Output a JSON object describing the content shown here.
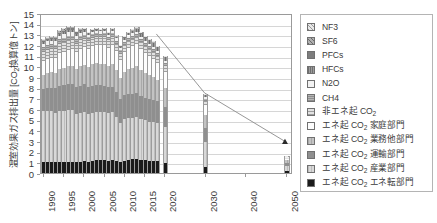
{
  "chart_data": {
    "type": "bar",
    "title": "",
    "ylabel": "温室効果ガス排出量 [CO2換算億トン]",
    "ylabel_main": "温室効果ガス排出量 [CO",
    "ylabel_sub": "2",
    "ylabel_tail": "換算億トン]",
    "xlabel": "",
    "ylim": [
      0,
      15
    ],
    "yticks": [
      0,
      1,
      2,
      3,
      4,
      5,
      6,
      7,
      8,
      9,
      10,
      11,
      12,
      13,
      14,
      15
    ],
    "grid": true,
    "legend_position": "right",
    "xlim": [
      1989.3,
      2051.5
    ],
    "xticks": [
      1990,
      1995,
      2000,
      2005,
      2010,
      2015,
      2020,
      2030,
      2040,
      2050
    ],
    "xtick_labels": [
      "1990",
      "1995",
      "2000",
      "2005",
      "2010",
      "2015",
      "2020",
      "2030",
      "2040",
      "2050"
    ],
    "series": [
      {
        "name": "エネ起 CO2 エネ転部門",
        "key": "enetenkan",
        "swatch": "s-enetenkan",
        "values": [
          1.02,
          1.03,
          1.03,
          1.02,
          1.07,
          1.06,
          1.07,
          1.06,
          1.03,
          1.07,
          1.09,
          1.07,
          1.14,
          1.2,
          1.18,
          1.18,
          1.15,
          1.2,
          1.13,
          1.06,
          1.1,
          1.21,
          1.27,
          1.29,
          1.26,
          1.21,
          1.17,
          1.14,
          1.1,
          0.96,
          0.55,
          0.22
        ]
      },
      {
        "name": "エネ起 CO2 産業部門",
        "key": "sangyo",
        "swatch": "s-sangyo",
        "values": [
          4.8,
          4.82,
          4.74,
          4.63,
          4.73,
          4.78,
          4.82,
          4.8,
          4.54,
          4.58,
          4.66,
          4.47,
          4.53,
          4.55,
          4.56,
          4.51,
          4.47,
          4.49,
          4.15,
          3.62,
          3.99,
          3.95,
          3.88,
          3.94,
          3.83,
          3.73,
          3.65,
          3.64,
          3.57,
          3.34,
          2.32,
          0.46
        ]
      },
      {
        "name": "エネ起 CO2 運輸部門",
        "key": "unyu",
        "swatch": "s-unyu",
        "values": [
          2.08,
          2.15,
          2.24,
          2.28,
          2.37,
          2.43,
          2.48,
          2.5,
          2.5,
          2.55,
          2.55,
          2.53,
          2.53,
          2.49,
          2.49,
          2.47,
          2.42,
          2.41,
          2.34,
          2.27,
          2.26,
          2.26,
          2.25,
          2.24,
          2.17,
          2.13,
          2.1,
          2.1,
          2.05,
          1.89,
          1.31,
          0.26
        ]
      },
      {
        "name": "エネ起 CO2 業務他部門",
        "key": "gyomu",
        "swatch": "s-gyomu",
        "values": [
          1.31,
          1.36,
          1.42,
          1.45,
          1.58,
          1.6,
          1.66,
          1.7,
          1.72,
          1.81,
          1.85,
          1.89,
          1.99,
          2.04,
          2.03,
          2.1,
          1.99,
          2.14,
          2.06,
          1.96,
          2.16,
          2.36,
          2.48,
          2.52,
          2.4,
          2.3,
          2.23,
          2.13,
          2.0,
          1.8,
          1.22,
          0.24
        ]
      },
      {
        "name": "エネ起 CO2 家庭部門",
        "key": "katei",
        "swatch": "s-katei",
        "values": [
          1.29,
          1.33,
          1.37,
          1.38,
          1.48,
          1.51,
          1.54,
          1.55,
          1.55,
          1.62,
          1.65,
          1.63,
          1.72,
          1.74,
          1.71,
          1.76,
          1.66,
          1.79,
          1.71,
          1.65,
          1.8,
          1.93,
          2.03,
          2.07,
          1.93,
          1.85,
          1.79,
          1.7,
          1.62,
          1.44,
          0.98,
          0.19
        ]
      },
      {
        "name": "非エネ起 CO2",
        "key": "hien",
        "swatch": "s-hien",
        "values": [
          0.88,
          0.88,
          0.87,
          0.84,
          0.87,
          0.88,
          0.88,
          0.86,
          0.8,
          0.81,
          0.8,
          0.77,
          0.76,
          0.76,
          0.76,
          0.75,
          0.75,
          0.76,
          0.71,
          0.64,
          0.68,
          0.67,
          0.67,
          0.67,
          0.66,
          0.65,
          0.65,
          0.64,
          0.63,
          0.58,
          0.4,
          0.08
        ]
      },
      {
        "name": "CH4",
        "key": "ch4",
        "swatch": "s-ch4",
        "values": [
          0.44,
          0.44,
          0.43,
          0.43,
          0.42,
          0.42,
          0.41,
          0.4,
          0.39,
          0.38,
          0.37,
          0.36,
          0.35,
          0.34,
          0.34,
          0.33,
          0.32,
          0.32,
          0.31,
          0.3,
          0.3,
          0.3,
          0.29,
          0.29,
          0.29,
          0.28,
          0.28,
          0.28,
          0.27,
          0.26,
          0.18,
          0.04
        ]
      },
      {
        "name": "N2O",
        "key": "n2o",
        "swatch": "s-n2o",
        "values": [
          0.32,
          0.32,
          0.32,
          0.31,
          0.32,
          0.32,
          0.32,
          0.31,
          0.28,
          0.27,
          0.26,
          0.24,
          0.23,
          0.23,
          0.23,
          0.23,
          0.22,
          0.22,
          0.21,
          0.2,
          0.21,
          0.21,
          0.21,
          0.21,
          0.21,
          0.2,
          0.2,
          0.2,
          0.2,
          0.19,
          0.13,
          0.03
        ]
      },
      {
        "name": "HFCs",
        "key": "hfcs",
        "swatch": "s-hfcs",
        "values": [
          0.16,
          0.17,
          0.18,
          0.19,
          0.2,
          0.2,
          0.21,
          0.22,
          0.22,
          0.21,
          0.19,
          0.15,
          0.12,
          0.11,
          0.1,
          0.12,
          0.14,
          0.16,
          0.18,
          0.2,
          0.23,
          0.26,
          0.3,
          0.34,
          0.37,
          0.39,
          0.41,
          0.43,
          0.45,
          0.44,
          0.3,
          0.06
        ]
      },
      {
        "name": "PFCs",
        "key": "pfcs",
        "swatch": "s-pfcs",
        "values": [
          0.07,
          0.08,
          0.09,
          0.1,
          0.12,
          0.14,
          0.16,
          0.17,
          0.16,
          0.13,
          0.11,
          0.08,
          0.07,
          0.07,
          0.07,
          0.07,
          0.06,
          0.06,
          0.05,
          0.04,
          0.04,
          0.04,
          0.04,
          0.04,
          0.04,
          0.04,
          0.04,
          0.04,
          0.03,
          0.03,
          0.02,
          0.01
        ]
      },
      {
        "name": "SF6",
        "key": "sf6",
        "swatch": "s-sf6",
        "values": [
          0.17,
          0.18,
          0.19,
          0.2,
          0.21,
          0.22,
          0.22,
          0.2,
          0.14,
          0.1,
          0.07,
          0.05,
          0.04,
          0.04,
          0.04,
          0.04,
          0.03,
          0.03,
          0.03,
          0.03,
          0.03,
          0.03,
          0.03,
          0.03,
          0.03,
          0.03,
          0.03,
          0.02,
          0.02,
          0.02,
          0.01,
          0.01
        ]
      },
      {
        "name": "NF3",
        "key": "nf3",
        "swatch": "s-nf3",
        "values": [
          0.01,
          0.01,
          0.01,
          0.01,
          0.02,
          0.02,
          0.02,
          0.02,
          0.02,
          0.02,
          0.02,
          0.02,
          0.02,
          0.02,
          0.02,
          0.02,
          0.02,
          0.02,
          0.02,
          0.01,
          0.01,
          0.01,
          0.01,
          0.01,
          0.01,
          0.01,
          0.01,
          0.01,
          0.01,
          0.01,
          0.01,
          0.0
        ]
      }
    ],
    "x_values": [
      1990,
      1991,
      1992,
      1993,
      1994,
      1995,
      1996,
      1997,
      1998,
      1999,
      2000,
      2001,
      2002,
      2003,
      2004,
      2005,
      2006,
      2007,
      2008,
      2009,
      2010,
      2011,
      2012,
      2013,
      2014,
      2015,
      2016,
      2017,
      2018,
      2020,
      2030,
      2050
    ],
    "target_line": {
      "name": "削減目標",
      "points": [
        [
          2018,
          13.2
        ],
        [
          2030,
          7.6
        ],
        [
          2050,
          3.0
        ]
      ],
      "marker": "triangle"
    }
  },
  "legend": {
    "items": [
      {
        "label": "NF3",
        "swatch": "s-nf3"
      },
      {
        "label": "SF6",
        "swatch": "s-sf6"
      },
      {
        "label": "PFCs",
        "swatch": "s-pfcs"
      },
      {
        "label": "HFCs",
        "swatch": "s-hfcs"
      },
      {
        "label": "N2O",
        "swatch": "s-n2o"
      },
      {
        "label": "CH4",
        "swatch": "s-ch4"
      },
      {
        "label": "非エネ起 CO",
        "sub": "2",
        "tail": "",
        "swatch": "s-hien"
      },
      {
        "label": "エネ起 CO",
        "sub": "2",
        "tail": " 家庭部門",
        "swatch": "s-katei"
      },
      {
        "label": "エネ起 CO",
        "sub": "2",
        "tail": " 業務他部門",
        "swatch": "s-gyomu"
      },
      {
        "label": "エネ起 CO",
        "sub": "2",
        "tail": " 運輸部門",
        "swatch": "s-unyu"
      },
      {
        "label": "エネ起 CO",
        "sub": "2",
        "tail": " 産業部門",
        "swatch": "s-sangyo"
      },
      {
        "label": "エネ起 CO",
        "sub": "2",
        "tail": " エネ転部門",
        "swatch": "s-enetenkan"
      }
    ]
  },
  "colors": {
    "axis": "#9a9a9a",
    "grid": "#d6d6d6",
    "text": "#3a3a3a",
    "line": "#8a8a8a",
    "background": "#ffffff"
  }
}
